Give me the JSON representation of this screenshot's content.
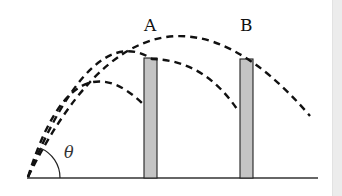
{
  "diagram": {
    "labels": {
      "wall_a": "A",
      "wall_b": "B",
      "angle": "θ"
    },
    "colors": {
      "line": "#111111",
      "wall_fill": "#c4c4c4",
      "ground": "#333333",
      "side_strip": "#ececec"
    },
    "elements": {
      "ground_line": {
        "x1": 27,
        "y1": 178,
        "x2": 318,
        "y2": 178
      },
      "wall_a": {
        "x": 144,
        "y": 58,
        "width": 13,
        "height": 120
      },
      "wall_b": {
        "x": 240,
        "y": 59,
        "width": 13,
        "height": 119
      },
      "trajectories": [
        {
          "name": "short",
          "ends_at": "wall A"
        },
        {
          "name": "middle",
          "grazes": "top of wall A",
          "ends_at": "wall B"
        },
        {
          "name": "long",
          "clears": [
            "wall A",
            "wall B"
          ]
        }
      ],
      "launch_point": {
        "x": 28,
        "y": 177
      }
    }
  }
}
